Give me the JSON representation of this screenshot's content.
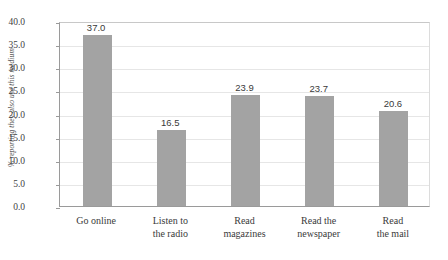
{
  "chart_data": {
    "type": "bar",
    "title": "",
    "subtitle": "",
    "xlabel": "",
    "ylabel": "% reporting they also use this medium",
    "categories": [
      "Go online",
      "Listen to the radio",
      "Read magazines",
      "Read the newspaper",
      "Read the mail"
    ],
    "category_lines": [
      [
        "Go online"
      ],
      [
        "Listen to",
        "the radio"
      ],
      [
        "Read",
        "magazines"
      ],
      [
        "Read the",
        "newspaper"
      ],
      [
        "Read",
        "the mail"
      ]
    ],
    "values": [
      37.0,
      16.5,
      23.9,
      23.7,
      20.6
    ],
    "value_labels": [
      "37.0",
      "16.5",
      "23.9",
      "23.7",
      "20.6"
    ],
    "ylim": [
      0.0,
      40.0
    ],
    "ytick_step": 5.0,
    "ytick_labels": [
      "40.0",
      "35.0",
      "30.0",
      "25.0",
      "20.0",
      "15.0",
      "10.0",
      "5.0",
      "0.0"
    ],
    "ytick_values": [
      40.0,
      35.0,
      30.0,
      25.0,
      20.0,
      15.0,
      10.0,
      5.0,
      0.0
    ],
    "grid": true,
    "legend": false,
    "legend_position": "none",
    "bar_color": "#a3a3a3",
    "grid_color": "#e6e6e6",
    "axis_color": "#9a9a9a",
    "background_color": "#ffffff",
    "text_color": "#3a3a3a"
  }
}
